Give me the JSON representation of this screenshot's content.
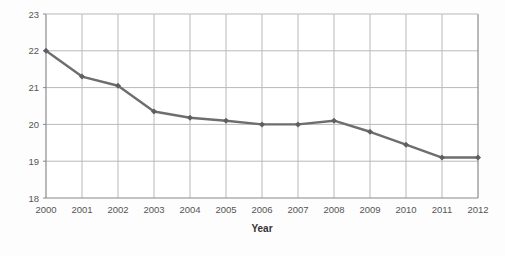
{
  "chart_data": {
    "type": "line",
    "title": "",
    "subtitle": "",
    "xlabel": "Year",
    "ylabel": "",
    "categories": [
      "2000",
      "2001",
      "2002",
      "2003",
      "2004",
      "2005",
      "2006",
      "2007",
      "2008",
      "2009",
      "2010",
      "2011",
      "2012"
    ],
    "x": [
      2000,
      2001,
      2002,
      2003,
      2004,
      2005,
      2006,
      2007,
      2008,
      2009,
      2010,
      2011,
      2012
    ],
    "values": [
      22.0,
      21.3,
      21.05,
      20.35,
      20.18,
      20.1,
      20.0,
      20.0,
      20.1,
      19.8,
      19.45,
      19.1,
      19.1
    ],
    "series": [
      {
        "name": "",
        "values": [
          22.0,
          21.3,
          21.05,
          20.35,
          20.18,
          20.1,
          20.0,
          20.0,
          20.1,
          19.8,
          19.45,
          19.1,
          19.1
        ]
      }
    ],
    "ylim": [
      18,
      23
    ],
    "xlim": [
      2000,
      2012
    ],
    "yticks": [
      18,
      19,
      20,
      21,
      22,
      23
    ],
    "ytick_labels": [
      "18",
      "19",
      "20",
      "21",
      "22",
      "23"
    ],
    "xtick_labels": [
      "2000",
      "2001",
      "2002",
      "2003",
      "2004",
      "2005",
      "2006",
      "2007",
      "2008",
      "2009",
      "2010",
      "2011",
      "2012"
    ],
    "grid": true,
    "grid_horizontal": true,
    "grid_vertical": true,
    "legend": false,
    "legend_position": "none",
    "marker": "diamond",
    "annotations": []
  },
  "style": {
    "background": "#fdfdfd",
    "plot_background": "#ffffff",
    "line_color": "#6e6e6e",
    "marker_color": "#5f5f5f",
    "grid_color": "#b9b9b9",
    "axis_color": "#8a8a8a",
    "tick_label_color": "#555555",
    "axis_title_color": "#333333"
  },
  "axis_titles": {
    "x": "Year"
  }
}
